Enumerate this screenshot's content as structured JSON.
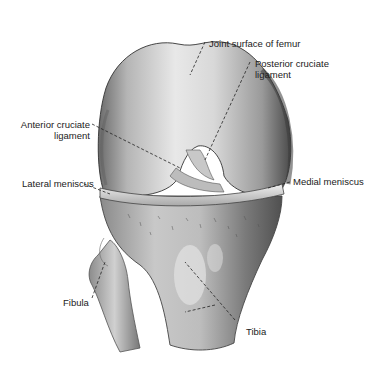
{
  "figure": {
    "labels": [
      {
        "id": "joint-surface-femur",
        "text": "Joint surface of femur"
      },
      {
        "id": "posterior-cruciate",
        "line1": "Posterior cruciate",
        "line2": "ligament"
      },
      {
        "id": "anterior-cruciate",
        "line1": "Anterior cruciate",
        "line2": "ligament"
      },
      {
        "id": "lateral-meniscus",
        "text": "Lateral meniscus"
      },
      {
        "id": "medial-meniscus",
        "text": "Medial meniscus"
      },
      {
        "id": "fibula",
        "text": "Fibula"
      },
      {
        "id": "tibia",
        "text": "Tibia"
      }
    ]
  }
}
